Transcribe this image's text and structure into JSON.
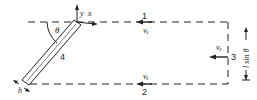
{
  "diagram": {
    "type": "control-volume-flow-diagram",
    "segments": [
      {
        "id": "1",
        "label": "1",
        "velocity_label": "vₓ",
        "position": "top"
      },
      {
        "id": "2",
        "label": "2",
        "velocity_label": "vₓ",
        "position": "bottom"
      },
      {
        "id": "3",
        "label": "3",
        "velocity_label": "vₓ",
        "position": "right"
      },
      {
        "id": "4",
        "label": "4",
        "position": "inclined-plate"
      }
    ],
    "angle_label": "θ",
    "axis_labels": {
      "y": "y",
      "x": "x"
    },
    "thickness_label": "h",
    "dimension_label": "l sin θ",
    "colors": {
      "line": "#222222",
      "background": "#ffffff"
    }
  }
}
